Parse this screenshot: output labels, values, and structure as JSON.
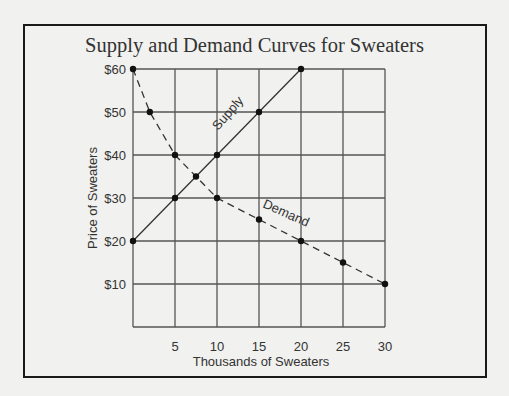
{
  "chart_data": {
    "type": "line",
    "title": "Supply and Demand Curves for Sweaters",
    "xlabel": "Thousands of Sweaters",
    "ylabel": "Price of Sweaters",
    "xlim": [
      0,
      30
    ],
    "ylim": [
      0,
      60
    ],
    "x_ticks": [
      "5",
      "10",
      "15",
      "20",
      "25",
      "30"
    ],
    "y_ticks": [
      "$10",
      "$20",
      "$30",
      "$40",
      "$50",
      "$60"
    ],
    "grid": true,
    "series": [
      {
        "name": "Supply",
        "style": "solid",
        "points": [
          [
            0,
            20
          ],
          [
            5,
            30
          ],
          [
            10,
            40
          ],
          [
            15,
            50
          ],
          [
            20,
            60
          ]
        ]
      },
      {
        "name": "Demand",
        "style": "dashed",
        "points": [
          [
            0,
            60
          ],
          [
            2,
            50
          ],
          [
            5,
            40
          ],
          [
            7.5,
            35
          ],
          [
            10,
            30
          ],
          [
            15,
            25
          ],
          [
            20,
            20
          ],
          [
            25,
            15
          ],
          [
            30,
            10
          ]
        ]
      }
    ],
    "annotations": [
      "Supply",
      "Demand"
    ]
  }
}
